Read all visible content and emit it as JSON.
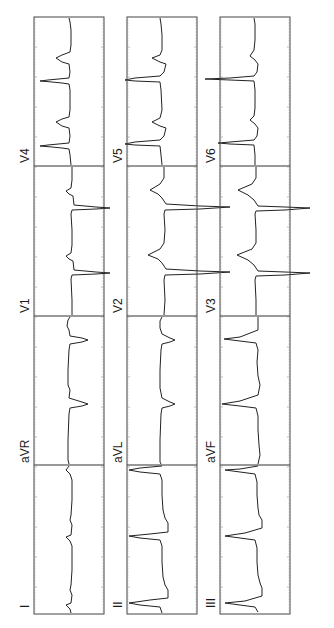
{
  "figure": {
    "type": "12-lead ECG (rotated 90° counter-clockwise)",
    "rows": [
      {
        "leads": [
          "I",
          "aVR",
          "V1",
          "V4"
        ]
      },
      {
        "leads": [
          "II",
          "aVL",
          "V2",
          "V5"
        ]
      },
      {
        "leads": [
          "III",
          "aVF",
          "V3",
          "V6"
        ]
      }
    ]
  },
  "labels": {
    "col1": [
      "I",
      "aVR",
      "V1",
      "V4"
    ],
    "col2": [
      "II",
      "aVL",
      "V2",
      "V5"
    ],
    "col3": [
      "III",
      "aVF",
      "V3",
      "V6"
    ]
  },
  "colors": {
    "trace": "#222222",
    "frame": "#444444",
    "background": "#ffffff"
  }
}
